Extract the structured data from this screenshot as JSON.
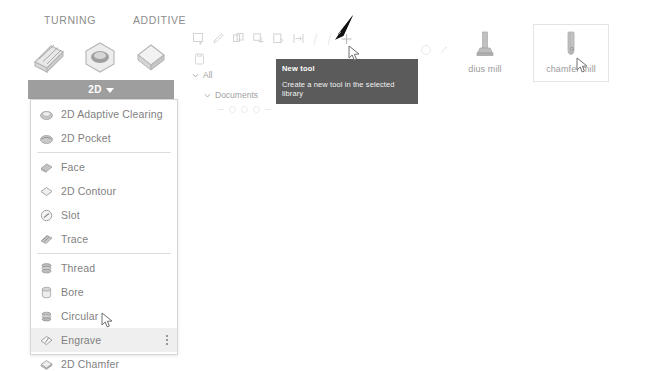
{
  "app": {
    "background": "#ffffff",
    "accent_gray": "#9e9e9e",
    "tooltip_bg": "#5b5b5b",
    "selected_row_bg": "#efefef"
  },
  "ribbon": {
    "tabs": [
      {
        "label": "TURNING",
        "name": "tab-turning"
      },
      {
        "label": "ADDITIVE",
        "name": "tab-additive"
      }
    ],
    "icons": [
      {
        "name": "turning-profile-icon"
      },
      {
        "name": "turning-groove-icon"
      },
      {
        "name": "additive-layer-icon"
      }
    ]
  },
  "twod_dropdown_button": {
    "label": "2D",
    "caret": "chevron-down-icon"
  },
  "menu": {
    "items": [
      {
        "label": "2D Adaptive Clearing",
        "icon": "adaptive-clearing-icon",
        "selected": false,
        "separator_after": false
      },
      {
        "label": "2D Pocket",
        "icon": "pocket-icon",
        "selected": false,
        "separator_after": true
      },
      {
        "label": "Face",
        "icon": "face-icon",
        "selected": false,
        "separator_after": false
      },
      {
        "label": "2D Contour",
        "icon": "contour-icon",
        "selected": false,
        "separator_after": false
      },
      {
        "label": "Slot",
        "icon": "slot-icon",
        "selected": false,
        "separator_after": false
      },
      {
        "label": "Trace",
        "icon": "trace-icon",
        "selected": false,
        "separator_after": true
      },
      {
        "label": "Thread",
        "icon": "thread-icon",
        "selected": false,
        "separator_after": false
      },
      {
        "label": "Bore",
        "icon": "bore-icon",
        "selected": false,
        "separator_after": false
      },
      {
        "label": "Circular",
        "icon": "circular-icon",
        "selected": false,
        "separator_after": false
      },
      {
        "label": "Engrave",
        "icon": "engrave-icon",
        "selected": true,
        "separator_after": false
      },
      {
        "label": "2D Chamfer",
        "icon": "chamfer-icon",
        "selected": false,
        "separator_after": false
      }
    ],
    "overflow_menu": "more-options-icon"
  },
  "toolbar": {
    "icons": [
      {
        "name": "new-tool-icon"
      },
      {
        "name": "edit-tool-icon"
      },
      {
        "name": "duplicate-tool-icon"
      },
      {
        "name": "copy-tool-icon"
      },
      {
        "name": "paste-tool-icon"
      },
      {
        "name": "import-tool-icon"
      },
      {
        "name": "add-new-icon"
      }
    ],
    "side_icon": "library-icon"
  },
  "tree": {
    "nodes": [
      {
        "label": "All",
        "expanded": true
      },
      {
        "label": "Documents",
        "expanded": true
      }
    ]
  },
  "tooltip": {
    "title": "New tool",
    "body": "Create a new tool in the selected library"
  },
  "tool_cards": [
    {
      "name": "dius mill",
      "thumb": "radius-mill-icon",
      "selected": false
    },
    {
      "name": "chamfer mill",
      "thumb": "chamfer-mill-icon",
      "selected": true
    }
  ],
  "annotation": {
    "arrow": "black-arrow-annotation"
  },
  "cursors": [
    {
      "name": "cursor-engrave"
    },
    {
      "name": "cursor-new-tool"
    },
    {
      "name": "cursor-chamfer-mill"
    }
  ]
}
